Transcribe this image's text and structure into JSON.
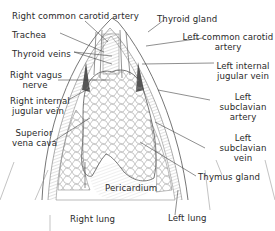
{
  "diagram": {
    "colors": {
      "ink": "#2a2a2a",
      "line": "#555555",
      "shade": "#9a9a9a",
      "background": "#ffffff"
    },
    "labels": {
      "right_common_carotid_artery": "Right common carotid artery",
      "trachea": "Trachea",
      "thyroid_veins": "Thyroid veins",
      "right_vagus_nerve_1": "Right vagus",
      "right_vagus_nerve_2": "nerve",
      "right_internal_jugular_vein_1": "Right internal",
      "right_internal_jugular_vein_2": "jugular vein",
      "superior_vena_cava_1": "Superior",
      "superior_vena_cava_2": "vena cava",
      "right_lung": "Right lung",
      "pericardium": "Pericardium",
      "thyroid_gland": "Thyroid gland",
      "left_common_carotid_artery_1": "Left common carotid",
      "left_common_carotid_artery_2": "artery",
      "left_internal_jugular_vein_1": "Left internal",
      "left_internal_jugular_vein_2": "jugular vein",
      "left_subclavian_artery_1": "Left",
      "left_subclavian_artery_2": "subclavian",
      "left_subclavian_artery_3": "artery",
      "left_subclavian_vein_1": "Left",
      "left_subclavian_vein_2": "subclavian",
      "left_subclavian_vein_3": "vein",
      "thymus_gland": "Thymus gland",
      "left_lung": "Left lung"
    }
  }
}
